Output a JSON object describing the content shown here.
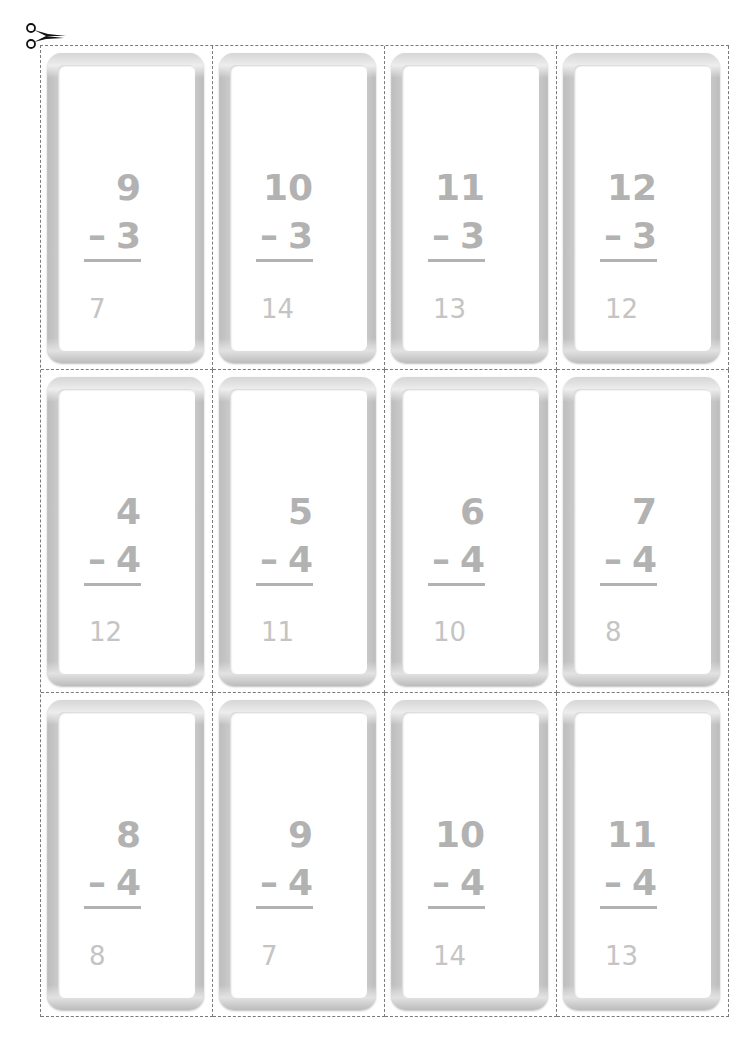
{
  "scissors_icon": "scissors-icon",
  "cards": [
    {
      "top": "9",
      "operator": "–",
      "bottom": "3",
      "answer": "7"
    },
    {
      "top": "10",
      "operator": "–",
      "bottom": "3",
      "answer": "14"
    },
    {
      "top": "11",
      "operator": "–",
      "bottom": "3",
      "answer": "13"
    },
    {
      "top": "12",
      "operator": "–",
      "bottom": "3",
      "answer": "12"
    },
    {
      "top": "4",
      "operator": "–",
      "bottom": "4",
      "answer": "12"
    },
    {
      "top": "5",
      "operator": "–",
      "bottom": "4",
      "answer": "11"
    },
    {
      "top": "6",
      "operator": "–",
      "bottom": "4",
      "answer": "10"
    },
    {
      "top": "7",
      "operator": "–",
      "bottom": "4",
      "answer": "8"
    },
    {
      "top": "8",
      "operator": "–",
      "bottom": "4",
      "answer": "8"
    },
    {
      "top": "9",
      "operator": "–",
      "bottom": "4",
      "answer": "7"
    },
    {
      "top": "10",
      "operator": "–",
      "bottom": "4",
      "answer": "14"
    },
    {
      "top": "11",
      "operator": "–",
      "bottom": "4",
      "answer": "13"
    }
  ],
  "colors": {
    "problem_text": "#b2b2b2",
    "answer_text": "#c4c4c4",
    "cut_line": "#7a7a7a"
  }
}
